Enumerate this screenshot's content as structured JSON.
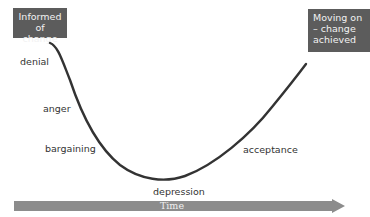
{
  "diagram": {
    "start_box": {
      "label": "Informed of change"
    },
    "end_box": {
      "label": "Moving on – change achieved"
    },
    "stages": [
      {
        "label": "denial"
      },
      {
        "label": "anger"
      },
      {
        "label": "bargaining"
      },
      {
        "label": "depression"
      },
      {
        "label": "acceptance"
      }
    ],
    "axis": {
      "label": "Time"
    },
    "colors": {
      "box": "#5c5c5c",
      "curve": "#333333",
      "arrow": "#8c8c8c",
      "text": "#333333"
    }
  }
}
